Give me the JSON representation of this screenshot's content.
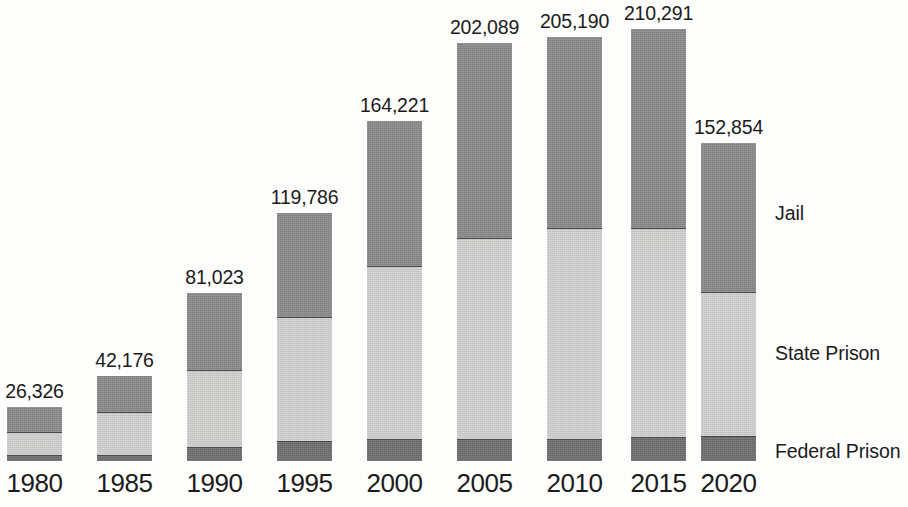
{
  "chart_data": {
    "type": "bar",
    "subtype": "stacked-vertical",
    "title": "",
    "subtitle": "",
    "xlabel": "",
    "ylabel": "",
    "grid": false,
    "legend_position": "right",
    "axis_line": false,
    "baseline_y_value": 0,
    "ylim": [
      0,
      210291
    ],
    "categories": [
      "1980",
      "1985",
      "1990",
      "1995",
      "2000",
      "2005",
      "2010",
      "2015",
      "2020"
    ],
    "series": [
      {
        "name": "Federal Prison",
        "color": "#6f6f6f",
        "values": [
          2300,
          900,
          3100,
          7700,
          9700,
          11400,
          11100,
          11600,
          10900
        ]
      },
      {
        "name": "State Prison",
        "color": "#d3d3d2",
        "values": [
          10700,
          15800,
          35000,
          48000,
          67000,
          78000,
          82000,
          81000,
          63000
        ]
      },
      {
        "name": "Jail",
        "color": "#8b8b8b",
        "values": [
          13326,
          25476,
          42923,
          64086,
          87521,
          112689,
          112090,
          117691,
          78954
        ]
      }
    ],
    "totals": [
      26326,
      42176,
      81023,
      119786,
      164221,
      202089,
      205190,
      210291,
      152854
    ],
    "total_labels": [
      "26,326",
      "42,176",
      "81,023",
      "119,786",
      "164,221",
      "202,089",
      "205,190",
      "210,291",
      "152,854"
    ],
    "annotations": []
  },
  "chart": {
    "bars": [
      {
        "year": "1980",
        "total_label": "26,326",
        "left": 6,
        "width": 57,
        "top": 406,
        "jail_state_y": 432,
        "state_fed_y": 456,
        "label_top": 380
      },
      {
        "year": "1985",
        "total_label": "42,176",
        "left": 96,
        "width": 57,
        "top": 375,
        "jail_state_y": 412,
        "state_fed_y": 456,
        "label_top": 349
      },
      {
        "year": "1990",
        "total_label": "81,023",
        "left": 186,
        "width": 57,
        "top": 292,
        "jail_state_y": 370,
        "state_fed_y": 448,
        "label_top": 266
      },
      {
        "year": "1995",
        "total_label": "119,786",
        "left": 276,
        "width": 57,
        "top": 212,
        "jail_state_y": 317,
        "state_fed_y": 442,
        "label_top": 186
      },
      {
        "year": "2000",
        "total_label": "164,221",
        "left": 366,
        "width": 57,
        "top": 120,
        "jail_state_y": 266,
        "state_fed_y": 440,
        "label_top": 94
      },
      {
        "year": "2005",
        "total_label": "202,089",
        "left": 456,
        "width": 57,
        "top": 42,
        "jail_state_y": 238,
        "state_fed_y": 440,
        "label_top": 16
      },
      {
        "year": "2010",
        "total_label": "205,190",
        "left": 546,
        "width": 57,
        "top": 36,
        "jail_state_y": 228,
        "state_fed_y": 440,
        "label_top": 10
      },
      {
        "year": "2015",
        "total_label": "210,291",
        "left": 630,
        "width": 57,
        "top": 28,
        "jail_state_y": 228,
        "state_fed_y": 438,
        "label_top": 2
      },
      {
        "year": "2020",
        "total_label": "152,854",
        "left": 700,
        "width": 57,
        "top": 142,
        "jail_state_y": 292,
        "state_fed_y": 437,
        "label_top": 116
      }
    ],
    "baseline_y": 462,
    "series_labels": [
      {
        "name": "Jail",
        "top": 202
      },
      {
        "name": "State Prison",
        "top": 342
      },
      {
        "name": "Federal Prison",
        "top": 440
      }
    ],
    "colors": {
      "jail": "#8b8b8b",
      "state_prison": "#d3d3d2",
      "federal_prison": "#6f6f6f",
      "text": "#1b1b1b",
      "background": "#fdfdfc"
    }
  }
}
